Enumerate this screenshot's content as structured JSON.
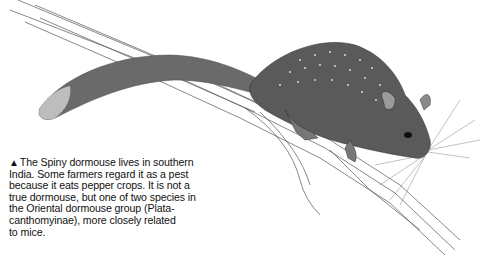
{
  "illustration": {
    "subject": "Spiny dormouse on a tree branch",
    "style": "pencil drawing"
  },
  "caption": {
    "marker_icon": "black-up-triangle",
    "marker_glyph": "▲",
    "lines": [
      "The Spiny dormouse lives in southern",
      "India. Some farmers regard it as a pest",
      "because it eats pepper crops. It is not a",
      "true dormouse, but one of two species in",
      "the Oriental dormouse group (Plata-",
      "canthomyinae), more closely related",
      "to mice."
    ]
  },
  "colors": {
    "text": "#111111",
    "background": "#ffffff",
    "fur_dark": "#4a4a4a",
    "fur_mid": "#7a7a7a",
    "branch_line": "#555555"
  }
}
